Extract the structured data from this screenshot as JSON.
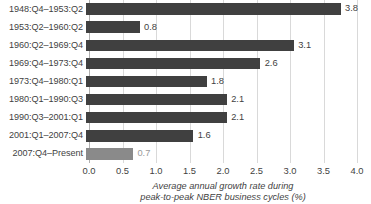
{
  "chart_data": {
    "type": "bar",
    "orientation": "horizontal",
    "title": "",
    "xlabel": "Average annual growth rate during peak-to-peak NBER business cycles (%)",
    "ylabel": "",
    "xlim": [
      0.0,
      4.0
    ],
    "grid": true,
    "legend": "none",
    "categories": [
      "1948:Q4–1953:Q2",
      "1953:Q2–1960:Q2",
      "1960:Q2–1969:Q4",
      "1969:Q4–1973:Q4",
      "1973:Q4–1980:Q1",
      "1980:Q1–1990:Q3",
      "1990:Q3–2001:Q1",
      "2001:Q1–2007:Q4",
      "2007:Q4–Present"
    ],
    "values": [
      3.8,
      0.8,
      3.1,
      2.6,
      1.8,
      2.1,
      2.1,
      1.6,
      0.7
    ],
    "value_labels": [
      "3.8",
      "0.8",
      "3.1",
      "2.6",
      "1.8",
      "2.1",
      "2.1",
      "1.6",
      "0.7"
    ],
    "bar_colors": [
      "#404040",
      "#404040",
      "#404040",
      "#404040",
      "#404040",
      "#404040",
      "#404040",
      "#404040",
      "#8a8a8a"
    ],
    "label_colors": [
      "#3f3f3f",
      "#3f3f3f",
      "#3f3f3f",
      "#3f3f3f",
      "#3f3f3f",
      "#3f3f3f",
      "#3f3f3f",
      "#3f3f3f",
      "#9a9a9a"
    ],
    "xticks": [
      0.0,
      0.5,
      1.0,
      1.5,
      2.0,
      2.5,
      3.0,
      3.5,
      4.0
    ],
    "xtick_labels": [
      "0.0",
      "0.5",
      "1.0",
      "1.5",
      "2.0",
      "2.5",
      "3.0",
      "3.5",
      "4.0"
    ],
    "axis_caption_lines": [
      "Average annual growth rate during",
      "peak-to-peak NBER business cycles (%)"
    ],
    "colors": {
      "bar_dark": "#404040",
      "bar_light": "#8a8a8a",
      "gridline": "#d9d9d9",
      "axis_line": "#b0b0b0",
      "text": "#3f3f3f",
      "muted_text": "#9a9a9a",
      "background": "#ffffff"
    }
  }
}
